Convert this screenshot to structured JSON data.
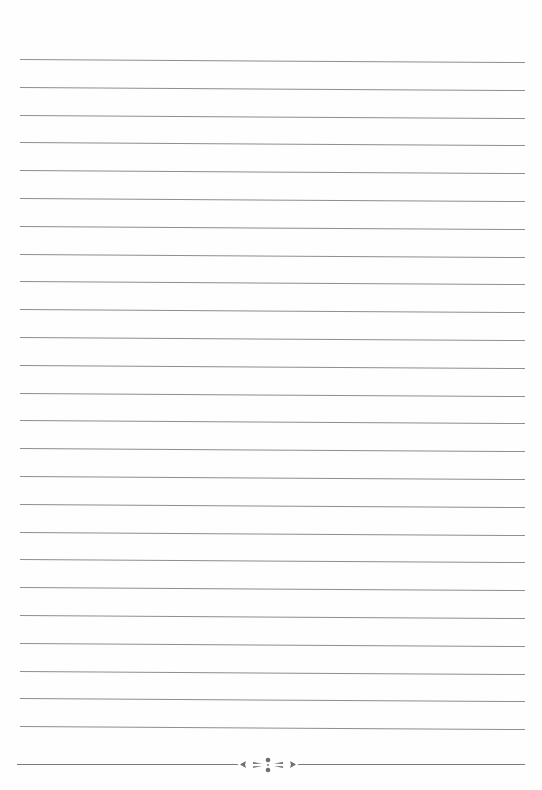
{
  "page": {
    "type": "lined-paper",
    "background": "#fefefe",
    "rule_color": "#8e8e8e",
    "rule_count": 25,
    "first_rule_y": 59,
    "rule_spacing": 27.8
  },
  "footer": {
    "ornament": "floral-divider-icon",
    "ornament_color": "#6e6e6e"
  }
}
